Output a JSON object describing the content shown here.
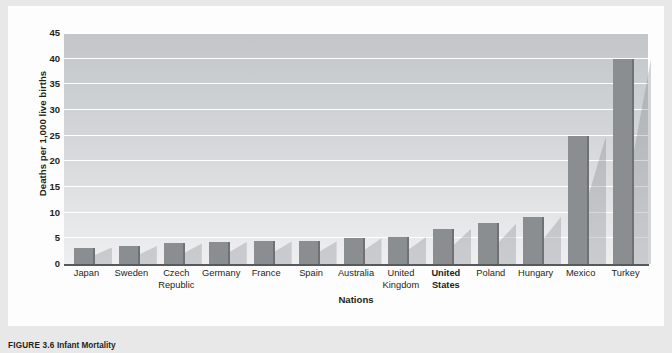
{
  "figure": {
    "caption_number": "FIGURE 3.6",
    "caption_title": "Infant Mortality"
  },
  "chart_data": {
    "type": "bar",
    "title": "",
    "subtitle": "",
    "xlabel": "Nations",
    "ylabel": "Deaths per 1,000 live births",
    "categories": [
      "Japan",
      "Sweden",
      "Czech Republic",
      "Germany",
      "France",
      "Spain",
      "Australia",
      "United Kingdom",
      "United States",
      "Poland",
      "Hungary",
      "Mexico",
      "Turkey"
    ],
    "category_lines": [
      [
        "Japan"
      ],
      [
        "Sweden"
      ],
      [
        "Czech",
        "Republic"
      ],
      [
        "Germany"
      ],
      [
        "France"
      ],
      [
        "Spain"
      ],
      [
        "Australia"
      ],
      [
        "United",
        "Kingdom"
      ],
      [
        "United",
        "States"
      ],
      [
        "Poland"
      ],
      [
        "Hungary"
      ],
      [
        "Mexico"
      ],
      [
        "Turkey"
      ]
    ],
    "values": [
      3.2,
      3.5,
      4.0,
      4.3,
      4.4,
      4.4,
      5.0,
      5.3,
      6.9,
      7.9,
      9.2,
      25.0,
      40.0
    ],
    "highlighted_category": "United States",
    "ylim": [
      0,
      45
    ],
    "yticks": [
      0,
      5,
      10,
      15,
      20,
      25,
      30,
      35,
      40,
      45
    ],
    "ytick_labels": [
      "0",
      "5",
      "10",
      "15",
      "20",
      "25",
      "30",
      "35",
      "40",
      "45"
    ],
    "grid": true,
    "grid_axis": "y",
    "legend": false,
    "bar_color": "#8b8e90",
    "bar_edge_color": "#6f7274",
    "plot_bg_top": "#c3c6c8",
    "plot_bg_bottom": "#efeff0",
    "gridline_color": "#ffffff",
    "axis_color": "#58595b",
    "text_color": "#231f20"
  }
}
